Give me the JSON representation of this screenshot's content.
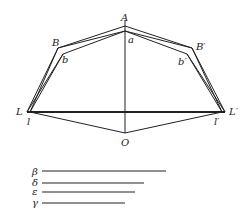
{
  "diagram": {
    "points": {
      "A": {
        "label": "A",
        "x": 125,
        "y": 26
      },
      "a": {
        "label": "a",
        "x": 125,
        "y": 31
      },
      "B": {
        "label": "B",
        "x": 58,
        "y": 48
      },
      "b": {
        "label": "b",
        "x": 63,
        "y": 54
      },
      "B_prime": {
        "label": "B′",
        "x": 192,
        "y": 48
      },
      "b_prime": {
        "label": "b′",
        "x": 187,
        "y": 54
      },
      "L": {
        "label": "L",
        "x": 27,
        "y": 112
      },
      "l": {
        "label": "l",
        "x": 30,
        "y": 112
      },
      "L_prime": {
        "label": "L′",
        "x": 225,
        "y": 112
      },
      "l_prime": {
        "label": "l′",
        "x": 222,
        "y": 112
      },
      "O": {
        "label": "O",
        "x": 125,
        "y": 133
      }
    },
    "legend": [
      {
        "symbol": "β",
        "length": 124
      },
      {
        "symbol": "δ",
        "length": 102
      },
      {
        "symbol": "ε",
        "length": 93
      },
      {
        "symbol": "γ",
        "length": 83
      }
    ]
  }
}
